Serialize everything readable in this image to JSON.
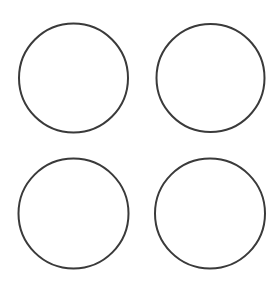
{
  "canvas": {
    "width": 279,
    "height": 284,
    "background": "#ffffff"
  },
  "style": {
    "stroke_color": "#3a3a3a",
    "stroke_width": 2,
    "fill": "#ffffff"
  },
  "circles": [
    {
      "name": "circle-top-left",
      "cx": 73.5,
      "cy": 78,
      "r": 54.5
    },
    {
      "name": "circle-top-right",
      "cx": 210.5,
      "cy": 78,
      "r": 54
    },
    {
      "name": "circle-bottom-left",
      "cx": 73.5,
      "cy": 213.5,
      "r": 55
    },
    {
      "name": "circle-bottom-right",
      "cx": 210,
      "cy": 213.5,
      "r": 55
    }
  ]
}
